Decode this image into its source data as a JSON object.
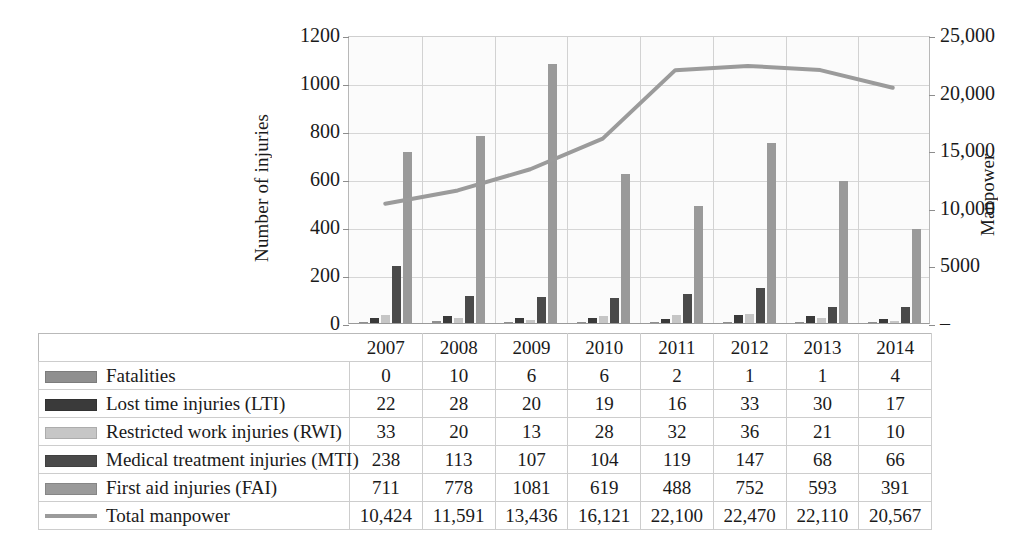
{
  "chart_data": {
    "type": "bar",
    "title": "",
    "xlabel": "",
    "ylabel": "Number of injuries",
    "y2label": "Manpower",
    "categories": [
      "2007",
      "2008",
      "2009",
      "2010",
      "2011",
      "2012",
      "2013",
      "2014"
    ],
    "ylim": [
      0,
      1200
    ],
    "y2lim": [
      0,
      25000
    ],
    "yticks": [
      "0",
      "200",
      "400",
      "600",
      "800",
      "1000",
      "1200"
    ],
    "ytick_values": [
      0,
      200,
      400,
      600,
      800,
      1000,
      1200
    ],
    "y2ticks": [
      "–",
      "5000",
      "10,000",
      "15,000",
      "20,000",
      "25,000"
    ],
    "y2tick_values": [
      0,
      5000,
      10000,
      15000,
      20000,
      25000
    ],
    "grid": true,
    "legend_position": "table-left",
    "series": [
      {
        "name": "Fatalities",
        "color": "#8f8f8f",
        "type": "bar",
        "values": [
          0,
          10,
          6,
          6,
          2,
          1,
          1,
          4
        ]
      },
      {
        "name": "Lost time injuries (LTI)",
        "color": "#3a3a3a",
        "type": "bar",
        "values": [
          22,
          28,
          20,
          19,
          16,
          33,
          30,
          17
        ]
      },
      {
        "name": "Restricted work injuries (RWI)",
        "color": "#c6c6c6",
        "type": "bar",
        "values": [
          33,
          20,
          13,
          28,
          32,
          36,
          21,
          10
        ]
      },
      {
        "name": "Medical treatment injuries (MTI)",
        "color": "#4a4a4a",
        "type": "bar",
        "values": [
          238,
          113,
          107,
          104,
          119,
          147,
          68,
          66
        ]
      },
      {
        "name": "First aid injuries (FAI)",
        "color": "#9a9a9a",
        "type": "bar",
        "values": [
          711,
          778,
          1081,
          619,
          488,
          752,
          593,
          391
        ]
      },
      {
        "name": "Total manpower",
        "color": "#9b9b9b",
        "type": "line",
        "axis": "y2",
        "values": [
          10424,
          11591,
          13436,
          16121,
          22100,
          22470,
          22110,
          20567
        ]
      }
    ]
  },
  "table": {
    "corner_label": "",
    "columns": [
      "2007",
      "2008",
      "2009",
      "2010",
      "2011",
      "2012",
      "2013",
      "2014"
    ],
    "rows": [
      {
        "label": "Fatalities",
        "swatch": "#8f8f8f",
        "kind": "bar",
        "values": [
          "0",
          "10",
          "6",
          "6",
          "2",
          "1",
          "1",
          "4"
        ]
      },
      {
        "label": "Lost time injuries (LTI)",
        "swatch": "#3a3a3a",
        "kind": "bar",
        "values": [
          "22",
          "28",
          "20",
          "19",
          "16",
          "33",
          "30",
          "17"
        ]
      },
      {
        "label": "Restricted work injuries (RWI)",
        "swatch": "#c6c6c6",
        "kind": "bar",
        "values": [
          "33",
          "20",
          "13",
          "28",
          "32",
          "36",
          "21",
          "10"
        ]
      },
      {
        "label": "Medical treatment injuries (MTI)",
        "swatch": "#4a4a4a",
        "kind": "bar",
        "values": [
          "238",
          "113",
          "107",
          "104",
          "119",
          "147",
          "68",
          "66"
        ]
      },
      {
        "label": "First aid injuries (FAI)",
        "swatch": "#9a9a9a",
        "kind": "bar",
        "values": [
          "711",
          "778",
          "1081",
          "619",
          "488",
          "752",
          "593",
          "391"
        ]
      },
      {
        "label": "Total manpower",
        "swatch": "#9b9b9b",
        "kind": "line",
        "values": [
          "10,424",
          "11,591",
          "13,436",
          "16,121",
          "22,100",
          "22,470",
          "22,110",
          "20,567"
        ]
      }
    ]
  },
  "axes": {
    "left_title": "Number of injuries",
    "right_title": "Manpower"
  }
}
